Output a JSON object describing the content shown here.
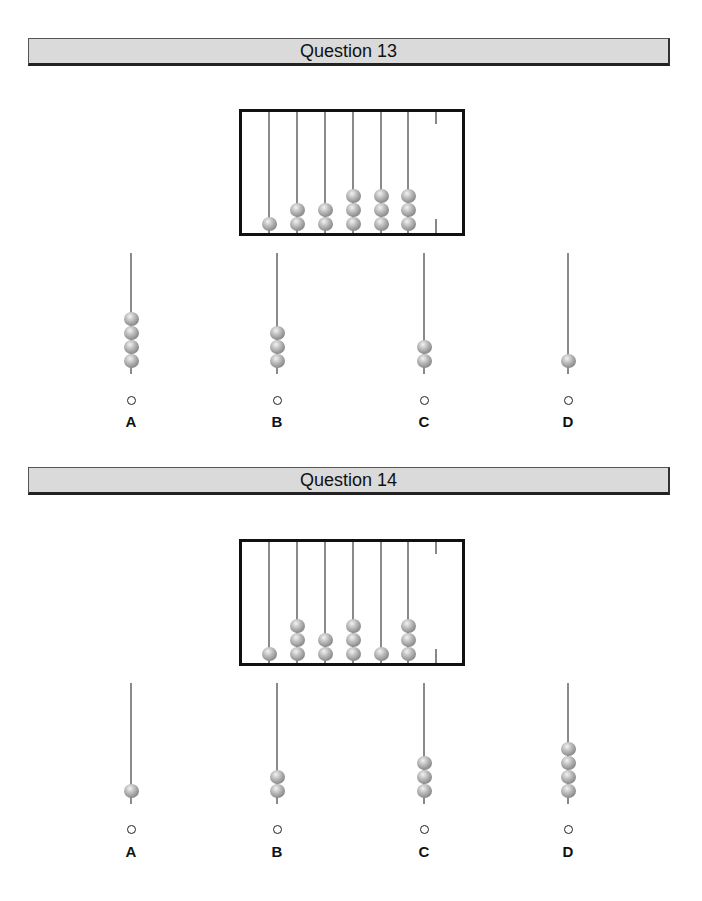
{
  "questions": [
    {
      "title": "Question 13",
      "abacus": {
        "beads_per_rod": [
          1,
          2,
          2,
          3,
          3,
          3
        ]
      },
      "options": [
        {
          "label": "A",
          "beads": 4
        },
        {
          "label": "B",
          "beads": 3
        },
        {
          "label": "C",
          "beads": 2
        },
        {
          "label": "D",
          "beads": 1
        }
      ]
    },
    {
      "title": "Question 14",
      "abacus": {
        "beads_per_rod": [
          1,
          3,
          2,
          3,
          1,
          3
        ]
      },
      "options": [
        {
          "label": "A",
          "beads": 1
        },
        {
          "label": "B",
          "beads": 2
        },
        {
          "label": "C",
          "beads": 3
        },
        {
          "label": "D",
          "beads": 4
        }
      ]
    }
  ],
  "colors": {
    "header_bg": "#dadada",
    "bead": "#9a9a9a",
    "rod": "#8a8a8a",
    "frame": "#111111"
  }
}
